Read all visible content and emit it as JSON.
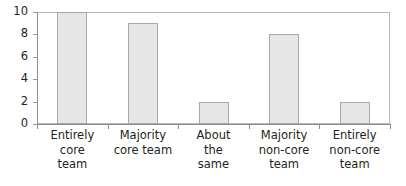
{
  "chart_data": {
    "type": "bar",
    "title": "",
    "subtitle": "",
    "xlabel": "",
    "ylabel": "",
    "categories": [
      "Entirely core team",
      "Majority core team",
      "About the same",
      "Majority non-core team",
      "Entirely non-core team"
    ],
    "category_lines": [
      [
        "Entirely",
        "core",
        "team"
      ],
      [
        "Majority",
        "core team"
      ],
      [
        "About",
        "the",
        "same"
      ],
      [
        "Majority",
        "non-core",
        "team"
      ],
      [
        "Entirely",
        "non-core",
        "team"
      ]
    ],
    "values": [
      10,
      9,
      2,
      8,
      2
    ],
    "ylim": [
      0,
      10
    ],
    "ytick_values": [
      0,
      2,
      4,
      6,
      8,
      10
    ],
    "ytick_labels": [
      "0",
      "2",
      "4",
      "6",
      "8",
      "10"
    ],
    "grid": false,
    "legend": false,
    "legend_position": "none",
    "bar_fill_color": "#e6e6e6",
    "bar_border_color": "#a8a8a8",
    "axis_color": "#8c8c8c",
    "frame_color": "#b9b9b9",
    "text_color": "#231f20",
    "background_color": "#ffffff"
  }
}
